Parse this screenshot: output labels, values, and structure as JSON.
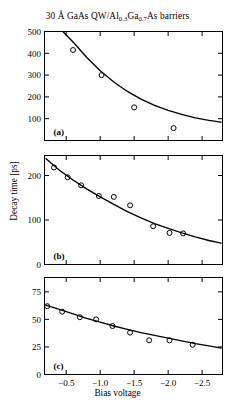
{
  "figure": {
    "title_main": "30 Å GaAs QW/Al",
    "title_sub1": "0.3",
    "title_mid": "Ga",
    "title_sub2": "0.7",
    "title_end": "As barriers",
    "title_full": "30 Å GaAs QW/Al0.3Ga0.7As barriers",
    "xlabel": "Bias voltage",
    "ylabel": "Decay time [ps]"
  },
  "chart_data": [
    {
      "type": "scatter",
      "panel": "(a)",
      "title": "30 Å GaAs QW/Al0.3Ga0.7As barriers",
      "xlabel": "Bias voltage",
      "ylabel": "Decay time [ps]",
      "xlim": [
        -0.18,
        -2.8
      ],
      "ylim": [
        0,
        500
      ],
      "xticks": [
        -0.5,
        -1.0,
        -1.5,
        -2.0,
        -2.5
      ],
      "xticklabels": [
        "-0.5",
        "-1.0",
        "-1.5",
        "-2.0",
        "-2.5"
      ],
      "yticks": [
        100,
        200,
        300,
        400,
        500
      ],
      "yticklabels": [
        "100",
        "200",
        "300",
        "400",
        "500"
      ],
      "grid": false,
      "legend": "none",
      "marker": "open-circle",
      "points": [
        {
          "x": -0.6,
          "y": 415
        },
        {
          "x": -1.02,
          "y": 300
        },
        {
          "x": -1.5,
          "y": 152
        },
        {
          "x": -2.08,
          "y": 57
        }
      ],
      "fit_curve": {
        "style": "solid",
        "description": "monotonic decay fit",
        "x": [
          -0.45,
          -0.6,
          -0.8,
          -1.0,
          -1.2,
          -1.4,
          -1.6,
          -1.8,
          -2.0,
          -2.2,
          -2.4,
          -2.6,
          -2.78
        ],
        "y": [
          500,
          452,
          382,
          320,
          268,
          225,
          190,
          161,
          138,
          120,
          104,
          92,
          84
        ]
      }
    },
    {
      "type": "scatter",
      "panel": "(b)",
      "xlabel": "Bias voltage",
      "ylabel": "Decay time [ps]",
      "xlim": [
        -0.18,
        -2.8
      ],
      "ylim": [
        0,
        245
      ],
      "xticks": [
        -0.5,
        -1.0,
        -1.5,
        -2.0,
        -2.5
      ],
      "xticklabels": [
        "-0.5",
        "-1.0",
        "-1.5",
        "-2.0",
        "-2.5"
      ],
      "yticks": [
        0,
        100,
        200
      ],
      "yticklabels": [
        "0",
        "100",
        "200"
      ],
      "grid": false,
      "legend": "none",
      "marker": "open-circle",
      "points": [
        {
          "x": -0.32,
          "y": 218
        },
        {
          "x": -0.52,
          "y": 196
        },
        {
          "x": -0.72,
          "y": 178
        },
        {
          "x": -0.98,
          "y": 154
        },
        {
          "x": -1.2,
          "y": 152
        },
        {
          "x": -1.44,
          "y": 133
        },
        {
          "x": -1.78,
          "y": 86
        },
        {
          "x": -2.02,
          "y": 71
        },
        {
          "x": -2.22,
          "y": 70
        }
      ],
      "fit_curve": {
        "style": "solid",
        "description": "monotonic decay fit",
        "x": [
          -0.2,
          -0.4,
          -0.6,
          -0.8,
          -1.0,
          -1.2,
          -1.4,
          -1.6,
          -1.8,
          -2.0,
          -2.2,
          -2.4,
          -2.6,
          -2.78
        ],
        "y": [
          238,
          212,
          190,
          170,
          152,
          135,
          119,
          105,
          92,
          81,
          71,
          62,
          54,
          48
        ]
      }
    },
    {
      "type": "scatter",
      "panel": "(c)",
      "xlabel": "Bias voltage",
      "ylabel": "Decay time [ps]",
      "xlim": [
        -0.18,
        -2.8
      ],
      "ylim": [
        0,
        88
      ],
      "xticks": [
        -0.5,
        -1.0,
        -1.5,
        -2.0,
        -2.5
      ],
      "xticklabels": [
        "-0.5",
        "-1.0",
        "-1.5",
        "-2.0",
        "-2.5"
      ],
      "yticks": [
        0,
        25,
        50,
        75
      ],
      "yticklabels": [
        "0",
        "25",
        "50",
        "75"
      ],
      "grid": false,
      "legend": "none",
      "marker": "open-circle",
      "points": [
        {
          "x": -0.22,
          "y": 62
        },
        {
          "x": -0.44,
          "y": 57
        },
        {
          "x": -0.7,
          "y": 52
        },
        {
          "x": -0.94,
          "y": 50
        },
        {
          "x": -1.18,
          "y": 44
        },
        {
          "x": -1.44,
          "y": 38
        },
        {
          "x": -1.72,
          "y": 31
        },
        {
          "x": -2.02,
          "y": 31
        },
        {
          "x": -2.36,
          "y": 27
        }
      ],
      "fit_curve": {
        "style": "solid",
        "description": "monotonic decay fit",
        "x": [
          -0.2,
          -0.4,
          -0.6,
          -0.8,
          -1.0,
          -1.2,
          -1.4,
          -1.6,
          -1.8,
          -2.0,
          -2.2,
          -2.4,
          -2.6,
          -2.78
        ],
        "y": [
          63,
          59,
          55,
          51,
          47.5,
          44,
          41,
          38,
          35.5,
          33,
          30.5,
          28,
          26,
          24
        ]
      }
    }
  ],
  "colors": {
    "ink": "#000000",
    "background": "#ffffff"
  }
}
